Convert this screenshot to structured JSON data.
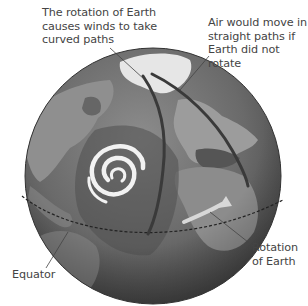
{
  "diagram": {
    "labels": {
      "curved_paths": "The rotation of Earth\ncauses winds to take\ncurved paths",
      "straight_paths": "Air would move in\nstraight paths if\nEarth did not rotate",
      "rotation": "Rotation\nof Earth",
      "equator": "Equator"
    },
    "elements": [
      {
        "name": "globe",
        "description": "Grayscale Earth globe showing North Atlantic, Europe, Africa and the Americas"
      },
      {
        "name": "hurricane-spiral",
        "description": "White spiral storm over the Atlantic"
      },
      {
        "name": "curved-path",
        "description": "Dark curved wind path from the pole southward"
      },
      {
        "name": "straight-path",
        "description": "Dark straight path from the pole toward the southeast"
      },
      {
        "name": "rotation-arrow",
        "description": "Light arrow pointing east-northeast"
      },
      {
        "name": "equator-line",
        "description": "Dashed line across the globe"
      }
    ],
    "colors": {
      "ocean_dark": "#4a4a4a",
      "ocean_light": "#8a8a8a",
      "land": "#9a9a9a",
      "ice": "#e8e8e8",
      "paths": "#3a3a3a",
      "arrow": "#d8d8d8",
      "text": "#444444"
    }
  }
}
